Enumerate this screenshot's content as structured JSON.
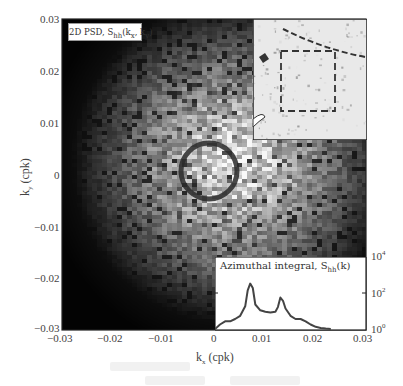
{
  "chart_data": [
    {
      "type": "heatmap",
      "title": "2D PSD, S_hh(k_x, k_y)",
      "xlabel": "k_x (cpk)",
      "ylabel": "k_y (cpk)",
      "xlim": [
        -0.03,
        0.03
      ],
      "ylim": [
        -0.03,
        0.03
      ],
      "x_ticks": [
        -0.03,
        -0.02,
        -0.01,
        0,
        0.01,
        0.02,
        0.03
      ],
      "y_ticks": [
        0.03,
        0.02,
        0.01,
        0,
        -0.01,
        -0.02,
        -0.03
      ],
      "colormap": "grayscale (black = low, white = high)",
      "features": [
        "bright broad central region, darker toward corners (esp. lower-left and upper-left)",
        "dark ring of radius ~0.007 cpk centered near origin"
      ],
      "ring_radius_cpk": 0.007
    },
    {
      "type": "line",
      "title": "Azimuthal integral, S_hh(k)",
      "xlim": [
        0,
        0.03
      ],
      "yscale": "log",
      "ylim": [
        1,
        10000
      ],
      "y_ticks": [
        "10^0",
        "10^2",
        "10^4"
      ],
      "series": [
        {
          "name": "S_hh(k)",
          "x": [
            0.0,
            0.001,
            0.002,
            0.003,
            0.004,
            0.005,
            0.006,
            0.0065,
            0.007,
            0.0075,
            0.008,
            0.009,
            0.01,
            0.011,
            0.012,
            0.0125,
            0.013,
            0.0135,
            0.014,
            0.015,
            0.016,
            0.017,
            0.018,
            0.019,
            0.02,
            0.021,
            0.022,
            0.023
          ],
          "values": [
            1,
            2,
            3,
            3,
            4,
            6,
            20,
            150,
            350,
            200,
            25,
            12,
            10,
            9,
            10,
            18,
            60,
            40,
            15,
            6,
            4,
            4,
            3,
            2,
            1.5,
            1.3,
            1.2,
            1
          ]
        }
      ],
      "peaks": [
        {
          "k": 0.007,
          "label": "primary"
        },
        {
          "k": 0.013,
          "label": "secondary"
        }
      ]
    },
    {
      "type": "image",
      "title": "inset photograph",
      "features": [
        "dashed square selection box",
        "dark curved feature near top"
      ]
    }
  ],
  "labels": {
    "psd_title_main": "2D PSD, S",
    "psd_title_sub": "hh",
    "psd_title_rest": "(k",
    "psd_kx_sub": "x",
    "psd_comma": ", k",
    "psd_ky_sub": "y",
    "psd_close": ")",
    "az_title": "Azimuthal integral, S",
    "az_sub": "hh",
    "az_rest": "(k)",
    "xlabel_k": "k",
    "xlabel_sub": "x",
    "xlabel_unit": " (cpk)",
    "ylabel_k": "k",
    "ylabel_sub": "y",
    "ylabel_unit": " (cpk)"
  },
  "ticks": {
    "x": [
      "−0.03",
      "−0.02",
      "−0.01",
      "0",
      "0.01",
      "0.02",
      "0.03"
    ],
    "y": [
      "0.03",
      "0.02",
      "0.01",
      "0",
      "−0.01",
      "−0.02",
      "−0.03"
    ],
    "az_y": [
      {
        "base": "10",
        "exp": "4"
      },
      {
        "base": "10",
        "exp": "2"
      },
      {
        "base": "10",
        "exp": "0"
      }
    ]
  }
}
